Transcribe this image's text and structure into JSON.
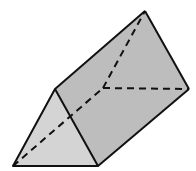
{
  "diagram": {
    "type": "triangular-prism",
    "colors": {
      "background": "#ffffff",
      "front_face": "#d4d4d4",
      "side_face": "#bdbdbd",
      "edge": "#111111"
    },
    "vertices": {
      "front_left": [
        13,
        166
      ],
      "front_apex": [
        55,
        89
      ],
      "front_right": [
        98,
        166
      ],
      "back_apex": [
        145,
        11
      ],
      "back_right": [
        189,
        89
      ],
      "back_left_hidden": [
        103,
        88
      ]
    },
    "visible_edges": [
      [
        "front_left",
        "front_apex"
      ],
      [
        "front_apex",
        "front_right"
      ],
      [
        "front_left",
        "front_right"
      ],
      [
        "front_apex",
        "back_apex"
      ],
      [
        "back_apex",
        "back_right"
      ],
      [
        "front_right",
        "back_right"
      ]
    ],
    "hidden_edges": [
      [
        "front_left",
        "back_left_hidden"
      ],
      [
        "back_left_hidden",
        "back_apex"
      ],
      [
        "back_left_hidden",
        "back_right"
      ]
    ]
  }
}
